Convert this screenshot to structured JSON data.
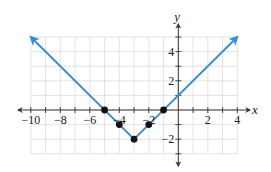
{
  "chart_data": {
    "type": "line",
    "title": "",
    "function": "y = |x + 3| - 2",
    "xlabel": "x",
    "ylabel": "y",
    "xlim": [
      -10,
      4
    ],
    "ylim": [
      -3,
      5
    ],
    "grid": true,
    "grid_step": 1,
    "x_ticks": [
      -10,
      -8,
      -6,
      -4,
      -2,
      2,
      4
    ],
    "x_tick_labels": [
      "−10",
      "−8",
      "−6",
      "−4",
      "−2",
      "2",
      "4"
    ],
    "y_ticks": [
      4,
      2,
      -2
    ],
    "y_tick_labels": [
      "4",
      "2",
      "−2"
    ],
    "series": [
      {
        "name": "y = |x+3| - 2",
        "color": "#3a8fd6",
        "x": [
          -10,
          -3,
          4
        ],
        "y": [
          5,
          -2,
          5
        ],
        "arrows": "both ends"
      }
    ],
    "points": [
      {
        "x": -5,
        "y": 0
      },
      {
        "x": -4,
        "y": -1
      },
      {
        "x": -3,
        "y": -2
      },
      {
        "x": -2,
        "y": -1
      },
      {
        "x": -1,
        "y": 0
      }
    ],
    "point_color": "#111111"
  },
  "colors": {
    "line": "#3a8fd6",
    "grid": "#dcdcdc",
    "axis": "#333333",
    "points": "#111111"
  }
}
